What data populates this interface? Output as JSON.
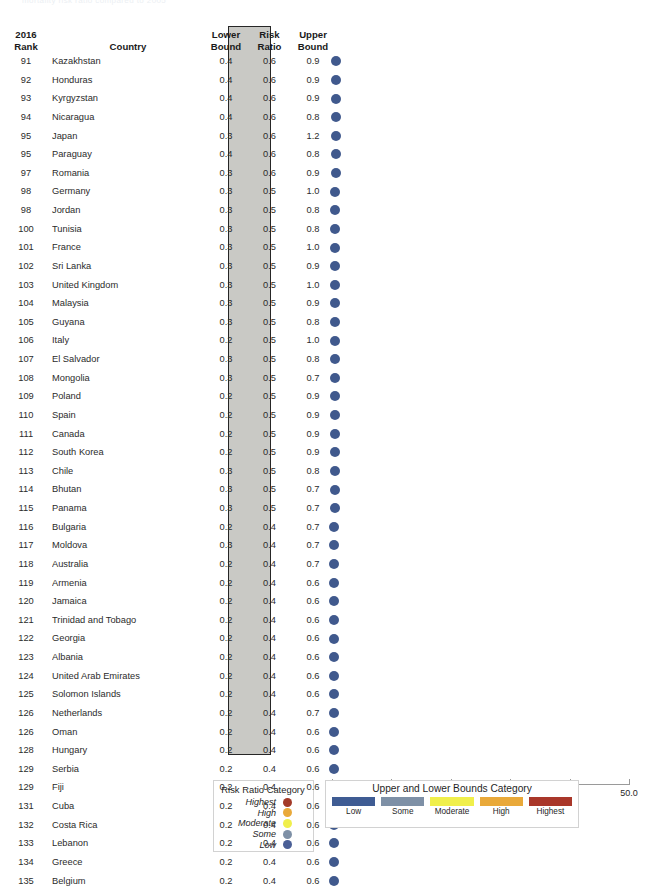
{
  "page": {
    "top_remnant": "mortality risk ratio compared to 2005"
  },
  "table": {
    "headers": {
      "rank_line1": "2016",
      "rank_line2": "Rank",
      "country": "Country",
      "lower_line1": "Lower",
      "lower_line2": "Bound",
      "risk_line1": "Risk",
      "risk_line2": "Ratio",
      "upper_line1": "Upper",
      "upper_line2": "Bound"
    },
    "rows": [
      {
        "rank": "91",
        "country": "Kazakhstan",
        "lower": "0.4",
        "risk": "0.6",
        "upper": "0.9"
      },
      {
        "rank": "92",
        "country": "Honduras",
        "lower": "0.4",
        "risk": "0.6",
        "upper": "0.9"
      },
      {
        "rank": "93",
        "country": "Kyrgyzstan",
        "lower": "0.4",
        "risk": "0.6",
        "upper": "0.9"
      },
      {
        "rank": "94",
        "country": "Nicaragua",
        "lower": "0.4",
        "risk": "0.6",
        "upper": "0.8"
      },
      {
        "rank": "95",
        "country": "Japan",
        "lower": "0.3",
        "risk": "0.6",
        "upper": "1.2"
      },
      {
        "rank": "95",
        "country": "Paraguay",
        "lower": "0.4",
        "risk": "0.6",
        "upper": "0.8"
      },
      {
        "rank": "97",
        "country": "Romania",
        "lower": "0.3",
        "risk": "0.6",
        "upper": "0.9"
      },
      {
        "rank": "98",
        "country": "Germany",
        "lower": "0.3",
        "risk": "0.5",
        "upper": "1.0"
      },
      {
        "rank": "98",
        "country": "Jordan",
        "lower": "0.3",
        "risk": "0.5",
        "upper": "0.8"
      },
      {
        "rank": "100",
        "country": "Tunisia",
        "lower": "0.3",
        "risk": "0.5",
        "upper": "0.8"
      },
      {
        "rank": "101",
        "country": "France",
        "lower": "0.3",
        "risk": "0.5",
        "upper": "1.0"
      },
      {
        "rank": "102",
        "country": "Sri Lanka",
        "lower": "0.3",
        "risk": "0.5",
        "upper": "0.9"
      },
      {
        "rank": "103",
        "country": "United Kingdom",
        "lower": "0.3",
        "risk": "0.5",
        "upper": "1.0"
      },
      {
        "rank": "104",
        "country": "Malaysia",
        "lower": "0.3",
        "risk": "0.5",
        "upper": "0.9"
      },
      {
        "rank": "105",
        "country": "Guyana",
        "lower": "0.3",
        "risk": "0.5",
        "upper": "0.8"
      },
      {
        "rank": "106",
        "country": "Italy",
        "lower": "0.2",
        "risk": "0.5",
        "upper": "1.0"
      },
      {
        "rank": "107",
        "country": "El Salvador",
        "lower": "0.3",
        "risk": "0.5",
        "upper": "0.8"
      },
      {
        "rank": "108",
        "country": "Mongolia",
        "lower": "0.3",
        "risk": "0.5",
        "upper": "0.7"
      },
      {
        "rank": "109",
        "country": "Poland",
        "lower": "0.2",
        "risk": "0.5",
        "upper": "0.9"
      },
      {
        "rank": "110",
        "country": "Spain",
        "lower": "0.2",
        "risk": "0.5",
        "upper": "0.9"
      },
      {
        "rank": "111",
        "country": "Canada",
        "lower": "0.2",
        "risk": "0.5",
        "upper": "0.9"
      },
      {
        "rank": "112",
        "country": "South Korea",
        "lower": "0.2",
        "risk": "0.5",
        "upper": "0.9"
      },
      {
        "rank": "113",
        "country": "Chile",
        "lower": "0.3",
        "risk": "0.5",
        "upper": "0.8"
      },
      {
        "rank": "114",
        "country": "Bhutan",
        "lower": "0.3",
        "risk": "0.5",
        "upper": "0.7"
      },
      {
        "rank": "115",
        "country": "Panama",
        "lower": "0.3",
        "risk": "0.5",
        "upper": "0.7"
      },
      {
        "rank": "116",
        "country": "Bulgaria",
        "lower": "0.2",
        "risk": "0.4",
        "upper": "0.7"
      },
      {
        "rank": "117",
        "country": "Moldova",
        "lower": "0.3",
        "risk": "0.4",
        "upper": "0.7"
      },
      {
        "rank": "118",
        "country": "Australia",
        "lower": "0.2",
        "risk": "0.4",
        "upper": "0.7"
      },
      {
        "rank": "119",
        "country": "Armenia",
        "lower": "0.2",
        "risk": "0.4",
        "upper": "0.6"
      },
      {
        "rank": "120",
        "country": "Jamaica",
        "lower": "0.2",
        "risk": "0.4",
        "upper": "0.6"
      },
      {
        "rank": "121",
        "country": "Trinidad and Tobago",
        "lower": "0.2",
        "risk": "0.4",
        "upper": "0.6"
      },
      {
        "rank": "122",
        "country": "Georgia",
        "lower": "0.2",
        "risk": "0.4",
        "upper": "0.6"
      },
      {
        "rank": "123",
        "country": "Albania",
        "lower": "0.2",
        "risk": "0.4",
        "upper": "0.6"
      },
      {
        "rank": "124",
        "country": "United Arab Emirates",
        "lower": "0.2",
        "risk": "0.4",
        "upper": "0.6"
      },
      {
        "rank": "125",
        "country": "Solomon Islands",
        "lower": "0.2",
        "risk": "0.4",
        "upper": "0.6"
      },
      {
        "rank": "126",
        "country": "Netherlands",
        "lower": "0.2",
        "risk": "0.4",
        "upper": "0.7"
      },
      {
        "rank": "126",
        "country": "Oman",
        "lower": "0.2",
        "risk": "0.4",
        "upper": "0.6"
      },
      {
        "rank": "128",
        "country": "Hungary",
        "lower": "0.2",
        "risk": "0.4",
        "upper": "0.6"
      },
      {
        "rank": "129",
        "country": "Serbia",
        "lower": "0.2",
        "risk": "0.4",
        "upper": "0.6"
      },
      {
        "rank": "129",
        "country": "Fiji",
        "lower": "0.2",
        "risk": "0.4",
        "upper": "0.6"
      },
      {
        "rank": "131",
        "country": "Cuba",
        "lower": "0.2",
        "risk": "0.4",
        "upper": "0.6"
      },
      {
        "rank": "132",
        "country": "Costa Rica",
        "lower": "0.2",
        "risk": "0.4",
        "upper": "0.6"
      },
      {
        "rank": "133",
        "country": "Lebanon",
        "lower": "0.2",
        "risk": "0.4",
        "upper": "0.6"
      },
      {
        "rank": "134",
        "country": "Greece",
        "lower": "0.2",
        "risk": "0.4",
        "upper": "0.6"
      },
      {
        "rank": "135",
        "country": "Belgium",
        "lower": "0.2",
        "risk": "0.4",
        "upper": "0.6"
      }
    ]
  },
  "chart_data": {
    "type": "scatter",
    "title": "",
    "xlabel": "",
    "ylabel": "",
    "xlim": [
      0.0,
      50.0
    ],
    "xticks": [
      "0.0",
      "10.0",
      "20.0",
      "30.0",
      "40.0",
      "50.0"
    ],
    "xtick_values": [
      0,
      10,
      20,
      30,
      40,
      50
    ],
    "grid": false,
    "marker_color": "#40598d",
    "categories": [
      "Kazakhstan",
      "Honduras",
      "Kyrgyzstan",
      "Nicaragua",
      "Japan",
      "Paraguay",
      "Romania",
      "Germany",
      "Jordan",
      "Tunisia",
      "France",
      "Sri Lanka",
      "United Kingdom",
      "Malaysia",
      "Guyana",
      "Italy",
      "El Salvador",
      "Mongolia",
      "Poland",
      "Spain",
      "Canada",
      "South Korea",
      "Chile",
      "Bhutan",
      "Panama",
      "Bulgaria",
      "Moldova",
      "Australia",
      "Armenia",
      "Jamaica",
      "Trinidad and Tobago",
      "Georgia",
      "Albania",
      "United Arab Emirates",
      "Solomon Islands",
      "Netherlands",
      "Oman",
      "Hungary",
      "Serbia",
      "Fiji",
      "Cuba",
      "Costa Rica",
      "Lebanon",
      "Greece",
      "Belgium"
    ],
    "series": [
      {
        "name": "Risk Ratio",
        "values": [
          0.6,
          0.6,
          0.6,
          0.6,
          0.6,
          0.6,
          0.6,
          0.5,
          0.5,
          0.5,
          0.5,
          0.5,
          0.5,
          0.5,
          0.5,
          0.5,
          0.5,
          0.5,
          0.5,
          0.5,
          0.5,
          0.5,
          0.5,
          0.5,
          0.5,
          0.4,
          0.4,
          0.4,
          0.4,
          0.4,
          0.4,
          0.4,
          0.4,
          0.4,
          0.4,
          0.4,
          0.4,
          0.4,
          0.4,
          0.4,
          0.4,
          0.4,
          0.4,
          0.4,
          0.4
        ]
      },
      {
        "name": "Lower Bound",
        "values": [
          0.4,
          0.4,
          0.4,
          0.4,
          0.3,
          0.4,
          0.3,
          0.3,
          0.3,
          0.3,
          0.3,
          0.3,
          0.3,
          0.3,
          0.3,
          0.2,
          0.3,
          0.3,
          0.2,
          0.2,
          0.2,
          0.2,
          0.3,
          0.3,
          0.3,
          0.2,
          0.3,
          0.2,
          0.2,
          0.2,
          0.2,
          0.2,
          0.2,
          0.2,
          0.2,
          0.2,
          0.2,
          0.2,
          0.2,
          0.2,
          0.2,
          0.2,
          0.2,
          0.2,
          0.2
        ]
      },
      {
        "name": "Upper Bound",
        "values": [
          0.9,
          0.9,
          0.9,
          0.8,
          1.2,
          0.8,
          0.9,
          1.0,
          0.8,
          0.8,
          1.0,
          0.9,
          1.0,
          0.9,
          0.8,
          1.0,
          0.8,
          0.7,
          0.9,
          0.9,
          0.9,
          0.9,
          0.8,
          0.7,
          0.7,
          0.7,
          0.7,
          0.7,
          0.6,
          0.6,
          0.6,
          0.6,
          0.6,
          0.6,
          0.6,
          0.7,
          0.6,
          0.6,
          0.6,
          0.6,
          0.6,
          0.6,
          0.6,
          0.6,
          0.6
        ]
      }
    ]
  },
  "legend_risk_ratio": {
    "title": "Risk Ratio Category",
    "items": [
      {
        "label": "Highest",
        "color": "#a33a28"
      },
      {
        "label": "High",
        "color": "#e9a93a"
      },
      {
        "label": "Moderate",
        "color": "#f0ef4b"
      },
      {
        "label": "Some",
        "color": "#7e90a6"
      },
      {
        "label": "Low",
        "color": "#4a5f96"
      }
    ]
  },
  "legend_bounds": {
    "title": "Upper and Lower Bounds Category",
    "items": [
      {
        "label": "Low",
        "color": "#3f5c93"
      },
      {
        "label": "Some",
        "color": "#7e90a6"
      },
      {
        "label": "Moderate",
        "color": "#f0ef4b"
      },
      {
        "label": "High",
        "color": "#e9a93a"
      },
      {
        "label": "Highest",
        "color": "#a9372a"
      }
    ]
  }
}
